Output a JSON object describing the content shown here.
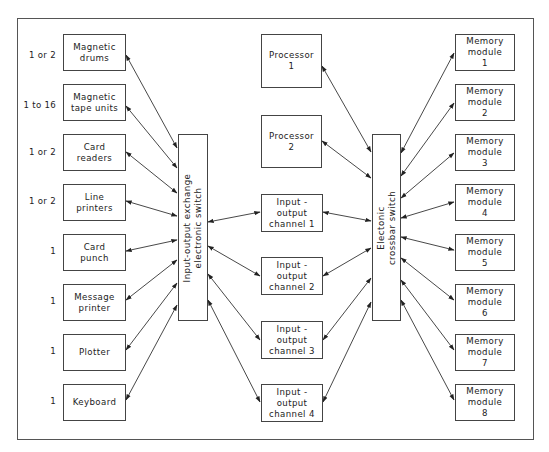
{
  "diagram": {
    "devices": [
      {
        "qty": "1 or 2",
        "label": "Magnetic\ndrums"
      },
      {
        "qty": "1 to 16",
        "label": "Magnetic\ntape units"
      },
      {
        "qty": "1 or 2",
        "label": "Card\nreaders"
      },
      {
        "qty": "1 or 2",
        "label": "Line\nprinters"
      },
      {
        "qty": "1",
        "label": "Card\npunch"
      },
      {
        "qty": "1",
        "label": "Message\nprinter"
      },
      {
        "qty": "1",
        "label": "Plotter"
      },
      {
        "qty": "1",
        "label": "Keyboard"
      }
    ],
    "io_exchange_switch": {
      "label": "Input-output exchange\nelectronic switch"
    },
    "processors": [
      {
        "label": "Processor\n1"
      },
      {
        "label": "Processor\n2"
      }
    ],
    "io_channels": [
      {
        "label": "Input -\noutput\nchannel 1"
      },
      {
        "label": "Input -\noutput\nchannel 2"
      },
      {
        "label": "Input -\noutput\nchannel 3"
      },
      {
        "label": "Input -\noutput\nchannel 4"
      }
    ],
    "crossbar_switch": {
      "label": "Electonic\ncrossbar switch"
    },
    "memory_modules": [
      {
        "label": "Memory\nmodule\n1"
      },
      {
        "label": "Memory\nmodule\n2"
      },
      {
        "label": "Memory\nmodule\n3"
      },
      {
        "label": "Memory\nmodule\n4"
      },
      {
        "label": "Memory\nmodule\n5"
      },
      {
        "label": "Memory\nmodule\n6"
      },
      {
        "label": "Memory\nmodule\n7"
      },
      {
        "label": "Memory\nmodule\n8"
      }
    ],
    "colors": {
      "line": "#333333",
      "box_border": "#444444",
      "background": "#ffffff"
    }
  }
}
